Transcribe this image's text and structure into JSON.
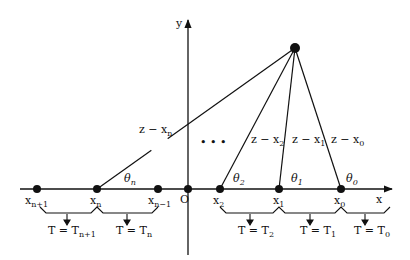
{
  "diagram": {
    "axes": {
      "x_label": "x",
      "y_label": "y",
      "origin_label": "O"
    },
    "source_point": {
      "label": "z"
    },
    "axis_points": [
      {
        "id": "xn1",
        "label": "x",
        "sub": "n+1"
      },
      {
        "id": "xn",
        "label": "x",
        "sub": "n"
      },
      {
        "id": "xnm1",
        "label": "x",
        "sub": "n−1"
      },
      {
        "id": "x2",
        "label": "x",
        "sub": "2"
      },
      {
        "id": "x1",
        "label": "x",
        "sub": "1"
      },
      {
        "id": "x0",
        "label": "x",
        "sub": "0"
      }
    ],
    "segments": [
      {
        "label": "z − x",
        "sub": "n"
      },
      {
        "label": "z − x",
        "sub": "2"
      },
      {
        "label": "z − x",
        "sub": "1"
      },
      {
        "label": "z − x",
        "sub": "0"
      }
    ],
    "angles": [
      {
        "label": "θ",
        "sub": "n"
      },
      {
        "label": "θ",
        "sub": "2"
      },
      {
        "label": "θ",
        "sub": "1"
      },
      {
        "label": "θ",
        "sub": "0"
      }
    ],
    "ellipsis": "•  •  •",
    "intervals": [
      {
        "label": "T = T",
        "sub": "n+1"
      },
      {
        "label": "T = T",
        "sub": "n"
      },
      {
        "label": "T = T",
        "sub": "2"
      },
      {
        "label": "T = T",
        "sub": "1"
      },
      {
        "label": "T = T",
        "sub": "0"
      }
    ]
  }
}
